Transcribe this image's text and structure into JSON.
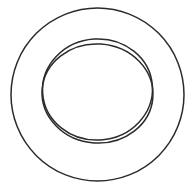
{
  "diagram": {
    "type": "concentric-shapes",
    "stroke_color": "#2b2b2b",
    "background_color": "#ffffff",
    "shapes": [
      {
        "id": "outer-circle",
        "kind": "circle"
      },
      {
        "id": "inner-ellipse-upper",
        "kind": "ellipse"
      },
      {
        "id": "inner-ellipse-lower",
        "kind": "ellipse"
      }
    ]
  }
}
